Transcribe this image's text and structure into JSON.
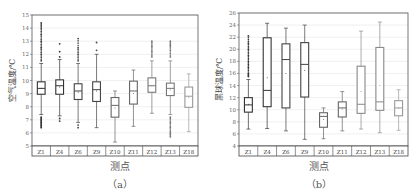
{
  "chart_data": [
    {
      "type": "box",
      "panel": "(a)",
      "ylabel": "空气温度/℃",
      "xlabel": "测点",
      "ylim": [
        5,
        15
      ],
      "yticks": [
        5,
        6,
        7,
        8,
        9,
        10,
        11,
        12,
        13,
        14,
        15
      ],
      "grid": true,
      "categories": [
        "Z1",
        "Z4",
        "Z6",
        "Z9",
        "Z10",
        "Z11",
        "Z12",
        "Z13",
        "Z18"
      ],
      "boxes": [
        {
          "name": "Z1",
          "whisker_low": 7.4,
          "q1": 8.95,
          "median": 9.4,
          "q3": 9.9,
          "whisker_high": 11.3,
          "mean": 9.4,
          "outliers_high": [
            11.5,
            12,
            12.5,
            13,
            13.5,
            14,
            14.4
          ],
          "outliers_low": [
            7.2,
            7.0,
            6.8,
            6.6,
            6.4
          ],
          "color": "#333333"
        },
        {
          "name": "Z4",
          "whisker_low": 7.3,
          "q1": 8.95,
          "median": 9.6,
          "q3": 10.05,
          "whisker_high": 11.6,
          "mean": 9.5,
          "outliers_high": [
            11.8,
            12.2,
            12.8
          ],
          "outliers_low": [
            7.1,
            6.9
          ],
          "color": "#333333"
        },
        {
          "name": "Z6",
          "whisker_low": 6.8,
          "q1": 8.55,
          "median": 9.2,
          "q3": 9.75,
          "whisker_high": 11.3,
          "mean": 9.1,
          "outliers_high": [
            11.5,
            12,
            12.5,
            13.2
          ],
          "outliers_low": [
            6.6,
            6.4
          ],
          "color": "#444444"
        },
        {
          "name": "Z9",
          "whisker_low": 6.4,
          "q1": 8.4,
          "median": 9.3,
          "q3": 9.9,
          "whisker_high": 12.0,
          "mean": 9.2,
          "outliers_high": [
            12.3,
            12.9
          ],
          "outliers_low": [],
          "color": "#444444"
        },
        {
          "name": "Z10",
          "whisker_low": 5.3,
          "q1": 7.2,
          "median": 8.1,
          "q3": 8.7,
          "whisker_high": 9.2,
          "mean": 7.9,
          "outliers_high": [],
          "outliers_low": [],
          "color": "#666666"
        },
        {
          "name": "Z11",
          "whisker_low": 6.5,
          "q1": 8.2,
          "median": 9.2,
          "q3": 9.95,
          "whisker_high": 10.8,
          "mean": 9.0,
          "outliers_high": [],
          "outliers_low": [],
          "color": "#666666"
        },
        {
          "name": "Z12",
          "whisker_low": 7.5,
          "q1": 9.1,
          "median": 9.6,
          "q3": 10.2,
          "whisker_high": 11.5,
          "mean": 9.6,
          "outliers_high": [
            11.8,
            12.2,
            12.6,
            13.0
          ],
          "outliers_low": [],
          "color": "#777777"
        },
        {
          "name": "Z13",
          "whisker_low": 7.4,
          "q1": 8.85,
          "median": 9.4,
          "q3": 9.8,
          "whisker_high": 11.5,
          "mean": 9.3,
          "outliers_high": [
            11.8,
            12.3,
            12.7,
            13.0
          ],
          "outliers_low": [
            7.2,
            6.8,
            6.4,
            6.0,
            5.7
          ],
          "color": "#777777"
        },
        {
          "name": "Z18",
          "whisker_low": 6.1,
          "q1": 7.95,
          "median": 8.8,
          "q3": 9.5,
          "whisker_high": 10.5,
          "mean": 8.7,
          "outliers_high": [],
          "outliers_low": [],
          "color": "#999999"
        }
      ]
    },
    {
      "type": "box",
      "panel": "(b)",
      "ylabel": "黑球温度/℃",
      "xlabel": "测点",
      "ylim": [
        4,
        26
      ],
      "yticks": [
        4,
        6,
        8,
        10,
        12,
        14,
        16,
        18,
        20,
        22,
        24,
        26
      ],
      "grid": true,
      "categories": [
        "Z1",
        "Z4",
        "Z6",
        "Z9",
        "Z10",
        "Z11",
        "Z12",
        "Z13",
        "Z18"
      ],
      "boxes": [
        {
          "name": "Z1",
          "whisker_low": 6.8,
          "q1": 9.6,
          "median": 10.8,
          "q3": 12.0,
          "whisker_high": 15.0,
          "mean": 10.9,
          "outliers_high": [
            15.5,
            16,
            17,
            18,
            19,
            20,
            21,
            22.2
          ],
          "outliers_low": [],
          "color": "#333333"
        },
        {
          "name": "Z4",
          "whisker_low": 6.9,
          "q1": 10.5,
          "median": 13.2,
          "q3": 21.9,
          "whisker_high": 24.3,
          "mean": 15.3,
          "outliers_high": [],
          "outliers_low": [],
          "color": "#333333"
        },
        {
          "name": "Z6",
          "whisker_low": 6.5,
          "q1": 10.3,
          "median": 18.3,
          "q3": 20.9,
          "whisker_high": 23.5,
          "mean": 16.0,
          "outliers_high": [],
          "outliers_low": [],
          "color": "#444444"
        },
        {
          "name": "Z9",
          "whisker_low": 5.1,
          "q1": 12.1,
          "median": 17.5,
          "q3": 21.1,
          "whisker_high": 24.0,
          "mean": 16.5,
          "outliers_high": [],
          "outliers_low": [],
          "color": "#444444"
        },
        {
          "name": "Z10",
          "whisker_low": 5.2,
          "q1": 7.1,
          "median": 8.9,
          "q3": 9.5,
          "whisker_high": 10.3,
          "mean": 8.4,
          "outliers_high": [],
          "outliers_low": [],
          "color": "#666666"
        },
        {
          "name": "Z11",
          "whisker_low": 6.5,
          "q1": 8.8,
          "median": 10.3,
          "q3": 11.3,
          "whisker_high": 13.0,
          "mean": 10.1,
          "outliers_high": [],
          "outliers_low": [],
          "color": "#666666"
        },
        {
          "name": "Z12",
          "whisker_low": 6.8,
          "q1": 9.4,
          "median": 10.9,
          "q3": 17.2,
          "whisker_high": 23.0,
          "mean": 13.0,
          "outliers_high": [],
          "outliers_low": [],
          "color": "#888888"
        },
        {
          "name": "Z13",
          "whisker_low": 6.2,
          "q1": 9.9,
          "median": 11.3,
          "q3": 20.3,
          "whisker_high": 24.5,
          "mean": 14.0,
          "outliers_high": [],
          "outliers_low": [],
          "color": "#888888"
        },
        {
          "name": "Z18",
          "whisker_low": 6.6,
          "q1": 9.0,
          "median": 10.3,
          "q3": 11.5,
          "whisker_high": 13.3,
          "mean": 10.2,
          "outliers_high": [],
          "outliers_low": [],
          "color": "#999999"
        }
      ]
    }
  ],
  "panels": [
    {
      "xlabel": "测点",
      "ylabel": "空气温度/℃",
      "caption": "（a）"
    },
    {
      "xlabel": "测点",
      "ylabel": "黑球温度/℃",
      "caption": "（b）"
    }
  ]
}
